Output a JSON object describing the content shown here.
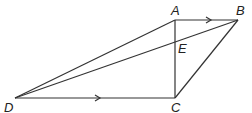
{
  "diagram": {
    "type": "geometry-figure",
    "points": {
      "A": {
        "label": "A",
        "x": 175,
        "y": 20
      },
      "B": {
        "label": "B",
        "x": 238,
        "y": 20
      },
      "C": {
        "label": "C",
        "x": 175,
        "y": 98
      },
      "D": {
        "label": "D",
        "x": 15,
        "y": 98
      },
      "E": {
        "label": "E",
        "x": 175,
        "y": 43
      }
    },
    "segments": [
      {
        "from": "A",
        "to": "B",
        "arrow": true
      },
      {
        "from": "D",
        "to": "C",
        "arrow": true
      },
      {
        "from": "A",
        "to": "C",
        "arrow": false
      },
      {
        "from": "C",
        "to": "B",
        "arrow": false
      },
      {
        "from": "D",
        "to": "A",
        "arrow": false
      },
      {
        "from": "D",
        "to": "B",
        "arrow": false
      }
    ],
    "line_color": "#333333"
  }
}
